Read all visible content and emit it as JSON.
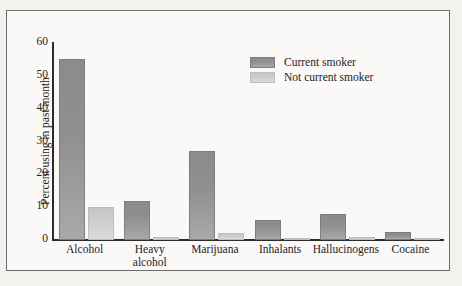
{
  "chart_data": {
    "type": "bar",
    "title": "",
    "xlabel": "",
    "ylabel": "Percent using in past month",
    "ylim": [
      0,
      60
    ],
    "yticks": [
      0,
      10,
      20,
      30,
      40,
      50,
      60
    ],
    "grid": false,
    "legend_position": "top-right",
    "categories": [
      "Alcohol",
      "Heavy alcohol",
      "Marijuana",
      "Inhalants",
      "Hallucinogens",
      "Cocaine"
    ],
    "category_lines": [
      [
        "Alcohol"
      ],
      [
        "Heavy",
        "alcohol"
      ],
      [
        "Marijuana"
      ],
      [
        "Inhalants"
      ],
      [
        "Hallucinogens"
      ],
      [
        "Cocaine"
      ]
    ],
    "series": [
      {
        "name": "Current smoker",
        "color": "#8b8b8b",
        "values": [
          55,
          12,
          27,
          6,
          8,
          2.5
        ]
      },
      {
        "name": "Not current smoker",
        "color": "#c9c9c9",
        "values": [
          10,
          0.8,
          2,
          0.7,
          0.8,
          0.4
        ]
      }
    ]
  },
  "legend": {
    "items": [
      {
        "label": "Current smoker",
        "swatch": "dark"
      },
      {
        "label": "Not current smoker",
        "swatch": "light"
      }
    ]
  },
  "axis": {
    "y_title": "Percent using in past month",
    "y_tick_labels": [
      "60",
      "50",
      "40",
      "30",
      "20",
      "10",
      "0"
    ]
  },
  "colors": {
    "bar_current_smoker": "#8b8b8b",
    "bar_not_current_smoker": "#c9c9c9",
    "axis": "#2b2b2b",
    "frame_border": "#6e6e6e",
    "page_background": "#f4f2ef",
    "plot_background": "#faf9f7",
    "text": "#26221f"
  }
}
